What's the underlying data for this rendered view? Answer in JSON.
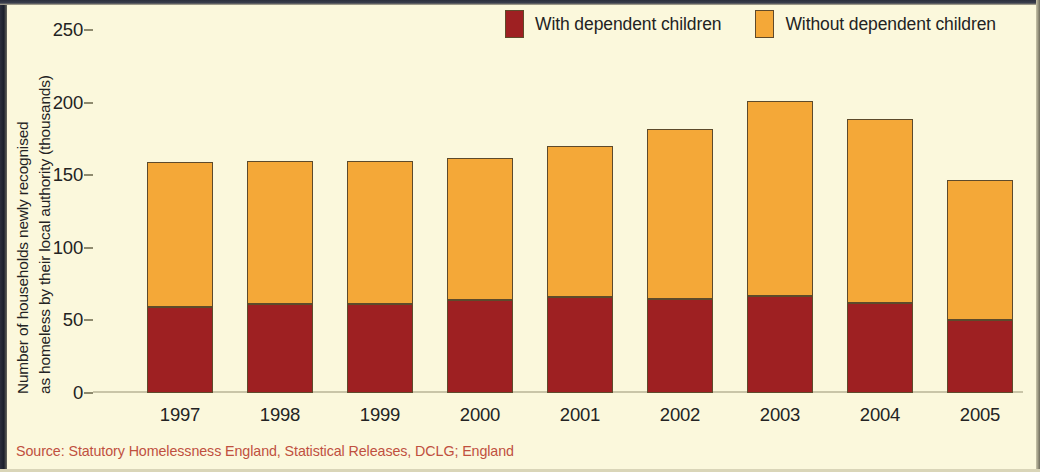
{
  "figure": {
    "background_color": "#FBF8DC",
    "source_note": "Source: Statutory Homelessness England, Statistical Releases, DCLG; England",
    "source_color": "#C0503F"
  },
  "axis": {
    "y_title_line1": "Number of households newly recognised",
    "y_title_line2": "as homeless by their local authority (thousands)"
  },
  "legend": {
    "items": [
      {
        "label": "With dependent children",
        "color": "#9E2022",
        "icon": "legend-swatch-icon"
      },
      {
        "label": "Without dependent children",
        "color": "#F4A838",
        "icon": "legend-swatch-icon"
      }
    ]
  },
  "chart_data": {
    "type": "bar",
    "stacked": true,
    "title": "",
    "subtitle": "",
    "xlabel": "",
    "ylabel": "Number of households newly recognised as homeless by their local authority (thousands)",
    "categories": [
      "1997",
      "1998",
      "1999",
      "2000",
      "2001",
      "2002",
      "2003",
      "2004",
      "2005"
    ],
    "series": [
      {
        "name": "With dependent children",
        "color": "#9E2022",
        "values": [
          59,
          61,
          61,
          64,
          66,
          65,
          67,
          62,
          50
        ]
      },
      {
        "name": "Without dependent children",
        "color": "#F4A838",
        "values": [
          100,
          99,
          99,
          98,
          104,
          117,
          134,
          127,
          97
        ]
      }
    ],
    "totals": [
      159,
      160,
      160,
      162,
      170,
      182,
      201,
      189,
      147
    ],
    "ylim": [
      0,
      250
    ],
    "yticks": [
      0,
      50,
      100,
      150,
      200,
      250
    ],
    "ytick_labels": [
      "0",
      "50",
      "100",
      "150",
      "200",
      "250"
    ],
    "grid": false,
    "legend_position": "top-right",
    "annotations": []
  }
}
